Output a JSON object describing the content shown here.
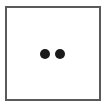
{
  "die": {
    "face_value": 2,
    "pips": [
      {
        "position": "center-left"
      },
      {
        "position": "center-right"
      }
    ],
    "colors": {
      "border": "#5a5a5a",
      "pip": "#1a1a1a",
      "face": "#ffffff"
    }
  }
}
